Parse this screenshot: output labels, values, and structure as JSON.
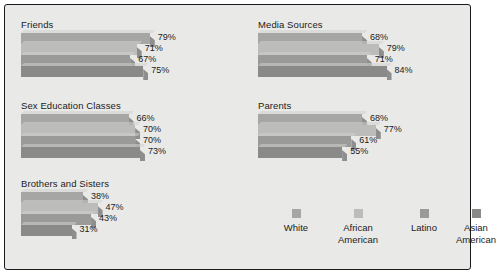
{
  "chart_data": {
    "type": "bar",
    "title": "",
    "xlabel": "",
    "ylabel": "",
    "orientation": "horizontal",
    "xlim": [
      0,
      100
    ],
    "grid": false,
    "legend_position": "bottom-right",
    "value_suffix": "%",
    "categories": [
      "Friends",
      "Sex Education Classes",
      "Brothers and Sisters",
      "Media Sources",
      "Parents"
    ],
    "series": [
      {
        "name": "White",
        "color": "#a6a6a4",
        "values": [
          79,
          66,
          38,
          68,
          68
        ]
      },
      {
        "name": "African American",
        "color": "#bcbcba",
        "values": [
          71,
          70,
          47,
          79,
          77
        ]
      },
      {
        "name": "Latino",
        "color": "#9a9a98",
        "values": [
          67,
          70,
          43,
          71,
          61
        ]
      },
      {
        "name": "Asian American",
        "color": "#8a8a88",
        "values": [
          75,
          73,
          31,
          84,
          55
        ]
      }
    ],
    "groups": [
      {
        "title": "Friends",
        "bars": [
          {
            "series": "White",
            "value": 79,
            "label": "79%",
            "color": "#a6a6a4"
          },
          {
            "series": "African American",
            "value": 71,
            "label": "71%",
            "color": "#bcbcba"
          },
          {
            "series": "Latino",
            "value": 67,
            "label": "67%",
            "color": "#9a9a98"
          },
          {
            "series": "Asian American",
            "value": 75,
            "label": "75%",
            "color": "#8a8a88"
          }
        ]
      },
      {
        "title": "Sex Education Classes",
        "bars": [
          {
            "series": "White",
            "value": 66,
            "label": "66%",
            "color": "#a6a6a4"
          },
          {
            "series": "African American",
            "value": 70,
            "label": "70%",
            "color": "#bcbcba"
          },
          {
            "series": "Latino",
            "value": 70,
            "label": "70%",
            "color": "#9a9a98"
          },
          {
            "series": "Asian American",
            "value": 73,
            "label": "73%",
            "color": "#8a8a88"
          }
        ]
      },
      {
        "title": "Brothers and Sisters",
        "bars": [
          {
            "series": "White",
            "value": 38,
            "label": "38%",
            "color": "#a6a6a4"
          },
          {
            "series": "African American",
            "value": 47,
            "label": "47%",
            "color": "#bcbcba"
          },
          {
            "series": "Latino",
            "value": 43,
            "label": "43%",
            "color": "#9a9a98"
          },
          {
            "series": "Asian American",
            "value": 31,
            "label": "31%",
            "color": "#8a8a88"
          }
        ]
      },
      {
        "title": "Media Sources",
        "bars": [
          {
            "series": "White",
            "value": 68,
            "label": "68%",
            "color": "#a6a6a4"
          },
          {
            "series": "African American",
            "value": 79,
            "label": "79%",
            "color": "#bcbcba"
          },
          {
            "series": "Latino",
            "value": 71,
            "label": "71%",
            "color": "#9a9a98"
          },
          {
            "series": "Asian American",
            "value": 84,
            "label": "84%",
            "color": "#8a8a88"
          }
        ]
      },
      {
        "title": "Parents",
        "bars": [
          {
            "series": "White",
            "value": 68,
            "label": "68%",
            "color": "#a6a6a4"
          },
          {
            "series": "African American",
            "value": 77,
            "label": "77%",
            "color": "#bcbcba"
          },
          {
            "series": "Latino",
            "value": 61,
            "label": "61%",
            "color": "#9a9a98"
          },
          {
            "series": "Asian American",
            "value": 55,
            "label": "55%",
            "color": "#8a8a88"
          }
        ]
      }
    ],
    "legend": [
      {
        "label_line1": "White",
        "label_line2": "",
        "color": "#a6a6a4"
      },
      {
        "label_line1": "African",
        "label_line2": "American",
        "color": "#bcbcba"
      },
      {
        "label_line1": "Latino",
        "label_line2": "",
        "color": "#9a9a98"
      },
      {
        "label_line1": "Asian",
        "label_line2": "American",
        "color": "#8a8a88"
      }
    ]
  },
  "panel": {
    "background_color": "#e9e9e7",
    "border_color": "#1a1a1a"
  }
}
